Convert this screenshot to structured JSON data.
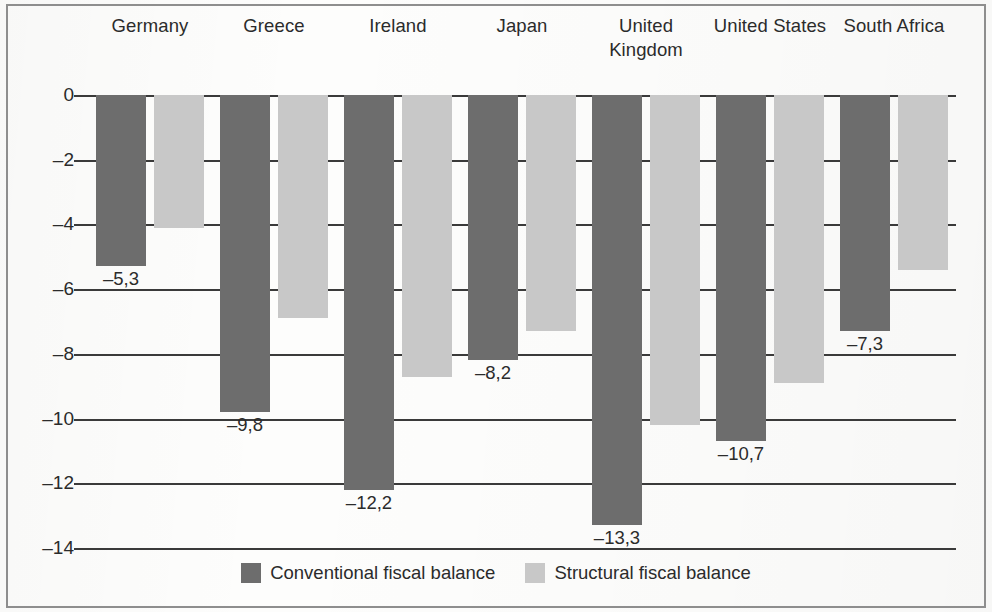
{
  "chart_data": {
    "type": "bar",
    "title": "",
    "subtitle": "",
    "xlabel": "",
    "ylabel": "",
    "categories": [
      "Germany",
      "Greece",
      "Ireland",
      "Japan",
      "United Kingdom",
      "United States",
      "South Africa"
    ],
    "ylim": [
      -14,
      0
    ],
    "yticks": [
      0,
      -2,
      -4,
      -6,
      -8,
      -10,
      -12,
      -14
    ],
    "ytick_labels": [
      "0",
      "–2",
      "–4",
      "–6",
      "–8",
      "–10",
      "–12",
      "–14"
    ],
    "grid": true,
    "legend_position": "bottom",
    "decimal_separator": ",",
    "series": [
      {
        "name": "Conventional fiscal balance",
        "color": "#6d6d6d",
        "values": [
          -5.3,
          -9.8,
          -12.2,
          -8.2,
          -13.3,
          -10.7,
          -7.3
        ],
        "labels": [
          "–5,3",
          "–9,8",
          "–12,2",
          "–8,2",
          "–13,3",
          "–10,7",
          "–7,3"
        ]
      },
      {
        "name": "Structural fiscal balance",
        "color": "#c8c8c8",
        "values": [
          -4.1,
          -6.9,
          -8.7,
          -7.3,
          -10.2,
          -8.9,
          -5.4
        ],
        "labels": [
          "",
          "",
          "",
          "",
          "",
          "",
          ""
        ]
      }
    ]
  },
  "legend": {
    "items": [
      {
        "label": "Conventional fiscal balance",
        "swatch": "dark"
      },
      {
        "label": "Structural fiscal balance",
        "swatch": "light"
      }
    ]
  }
}
